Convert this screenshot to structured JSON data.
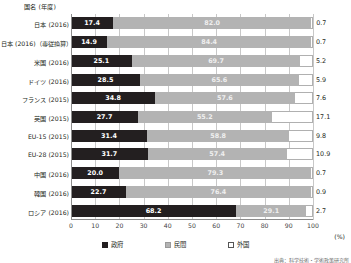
{
  "axis_title": "国名 (年度)",
  "unit_label": "(%)",
  "source_note": "出典：科学技術・学術政策研究所",
  "legend": {
    "position": "bottom",
    "items": [
      {
        "label": "政府",
        "color": "#231f20",
        "key": "government"
      },
      {
        "label": "民間",
        "color": "#b3b3b3",
        "key": "private"
      },
      {
        "label": "外国",
        "color": "#ffffff",
        "key": "foreign"
      }
    ]
  },
  "chart_data": {
    "type": "bar",
    "orientation": "horizontal",
    "stacked": true,
    "title": "",
    "xlabel": "(%)",
    "ylabel": "国名 (年度)",
    "xlim": [
      0,
      100
    ],
    "xticks": [
      0,
      10,
      20,
      30,
      40,
      50,
      60,
      70,
      80,
      90,
      100
    ],
    "grid": true,
    "categories": [
      "日本 (2016)",
      "日本 (2016)（専従換算）",
      "米国 (2016)",
      "ドイツ (2016)",
      "フランス (2015)",
      "英国 (2015)",
      "EU-15 (2015)",
      "EU-28 (2015)",
      "中国 (2016)",
      "韓国 (2016)",
      "ロシア (2016)"
    ],
    "series": [
      {
        "name": "政府",
        "color": "#231f20",
        "values": [
          17.4,
          14.9,
          25.1,
          28.5,
          34.8,
          27.7,
          31.4,
          31.7,
          20.0,
          22.7,
          68.2
        ]
      },
      {
        "name": "民間",
        "color": "#b3b3b3",
        "values": [
          82.0,
          84.4,
          69.7,
          65.6,
          57.6,
          55.2,
          58.8,
          57.4,
          79.3,
          76.4,
          29.1
        ]
      },
      {
        "name": "外国",
        "color": "#ffffff",
        "values": [
          0.7,
          0.7,
          5.2,
          5.9,
          7.6,
          17.1,
          9.8,
          10.9,
          0.7,
          0.9,
          2.7
        ]
      }
    ]
  }
}
